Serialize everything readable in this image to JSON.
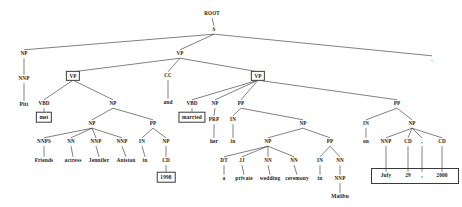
{
  "diagram": {
    "sentence": "Pitt met Friends actress Jennifer Aniston in 1998 and married her in a private wedding ceremony in Malibu on July 29 , 2000 .",
    "stroke_color": "#2b2b2b",
    "text_color": "#1a1a1a",
    "box_border_color": "#3a3a3a",
    "background": "#ffffff",
    "width": 462,
    "height": 207
  },
  "nodes": [
    {
      "id": "root",
      "label": "ROOT",
      "x": 212,
      "y": 14,
      "kind": "tag"
    },
    {
      "id": "s",
      "label": "S",
      "x": 214,
      "y": 30,
      "kind": "tag"
    },
    {
      "id": "np1",
      "label": "NP",
      "x": 24,
      "y": 54,
      "kind": "tag"
    },
    {
      "id": "vp_top",
      "label": "VP",
      "x": 180,
      "y": 54,
      "kind": "tag"
    },
    {
      "id": "period",
      "label": ".",
      "x": 432,
      "y": 60,
      "kind": "punct"
    },
    {
      "id": "nnp_pitt",
      "label": "NNP",
      "x": 24,
      "y": 79,
      "kind": "tag"
    },
    {
      "id": "vp_left",
      "label": "VP",
      "x": 73,
      "y": 76,
      "kind": "boxed-tag"
    },
    {
      "id": "cc",
      "label": "CC",
      "x": 168,
      "y": 76,
      "kind": "tag"
    },
    {
      "id": "vp_right",
      "label": "VP",
      "x": 258,
      "y": 76,
      "kind": "boxed-tag"
    },
    {
      "id": "pitt",
      "label": "Pitt",
      "x": 24,
      "y": 105,
      "kind": "leaf"
    },
    {
      "id": "vbd_met",
      "label": "VBD",
      "x": 44,
      "y": 104,
      "kind": "tag"
    },
    {
      "id": "np_obj",
      "label": "NP",
      "x": 113,
      "y": 104,
      "kind": "tag"
    },
    {
      "id": "and",
      "label": "and",
      "x": 168,
      "y": 103,
      "kind": "leaf"
    },
    {
      "id": "vbd_marr",
      "label": "VBD",
      "x": 192,
      "y": 104,
      "kind": "tag"
    },
    {
      "id": "np_her",
      "label": "NP",
      "x": 215,
      "y": 104,
      "kind": "tag"
    },
    {
      "id": "pp_in1",
      "label": "PP",
      "x": 241,
      "y": 104,
      "kind": "tag"
    },
    {
      "id": "pp_on",
      "label": "PP",
      "x": 397,
      "y": 104,
      "kind": "tag"
    },
    {
      "id": "met",
      "label": "met",
      "x": 44,
      "y": 117,
      "kind": "boxed"
    },
    {
      "id": "married",
      "label": "married",
      "x": 192,
      "y": 117,
      "kind": "boxed"
    },
    {
      "id": "np_inner",
      "label": "NP",
      "x": 92,
      "y": 124,
      "kind": "tag"
    },
    {
      "id": "pp_in98",
      "label": "PP",
      "x": 153,
      "y": 124,
      "kind": "tag"
    },
    {
      "id": "prp",
      "label": "PRP",
      "x": 214,
      "y": 120,
      "kind": "tag"
    },
    {
      "id": "in_in",
      "label": "IN",
      "x": 233,
      "y": 120,
      "kind": "tag"
    },
    {
      "id": "np_wed",
      "label": "NP",
      "x": 303,
      "y": 124,
      "kind": "tag"
    },
    {
      "id": "in_on",
      "label": "IN",
      "x": 366,
      "y": 124,
      "kind": "tag"
    },
    {
      "id": "np_date",
      "label": "NP",
      "x": 412,
      "y": 124,
      "kind": "tag"
    },
    {
      "id": "nnps",
      "label": "NNPS",
      "x": 44,
      "y": 142,
      "kind": "tag"
    },
    {
      "id": "nn_act",
      "label": "NN",
      "x": 71,
      "y": 142,
      "kind": "tag"
    },
    {
      "id": "nnp_jen",
      "label": "NNP",
      "x": 96,
      "y": 142,
      "kind": "tag"
    },
    {
      "id": "nnp_ani",
      "label": "NNP",
      "x": 122,
      "y": 142,
      "kind": "tag"
    },
    {
      "id": "in_1998",
      "label": "IN",
      "x": 142,
      "y": 142,
      "kind": "tag"
    },
    {
      "id": "np_1998",
      "label": "NP",
      "x": 166,
      "y": 142,
      "kind": "tag"
    },
    {
      "id": "her",
      "label": "her",
      "x": 214,
      "y": 142,
      "kind": "leaf"
    },
    {
      "id": "in_leaf1",
      "label": "in",
      "x": 233,
      "y": 142,
      "kind": "leaf"
    },
    {
      "id": "np_wed2",
      "label": "NP",
      "x": 268,
      "y": 142,
      "kind": "tag"
    },
    {
      "id": "pp_mal",
      "label": "PP",
      "x": 330,
      "y": 142,
      "kind": "tag"
    },
    {
      "id": "on",
      "label": "on",
      "x": 366,
      "y": 142,
      "kind": "leaf"
    },
    {
      "id": "nnp_july",
      "label": "NNP",
      "x": 386,
      "y": 142,
      "kind": "tag"
    },
    {
      "id": "cd_29",
      "label": "CD",
      "x": 408,
      "y": 142,
      "kind": "tag"
    },
    {
      "id": "comma_tag",
      "label": ",",
      "x": 422,
      "y": 142,
      "kind": "tag"
    },
    {
      "id": "cd_2000",
      "label": "CD",
      "x": 442,
      "y": 142,
      "kind": "tag"
    },
    {
      "id": "friends",
      "label": "Friends",
      "x": 44,
      "y": 161,
      "kind": "leaf"
    },
    {
      "id": "actress",
      "label": "actress",
      "x": 73,
      "y": 161,
      "kind": "leaf"
    },
    {
      "id": "jennifer",
      "label": "Jennifer",
      "x": 99,
      "y": 161,
      "kind": "leaf"
    },
    {
      "id": "aniston",
      "label": "Aniston",
      "x": 126,
      "y": 161,
      "kind": "leaf"
    },
    {
      "id": "in_leaf2",
      "label": "in",
      "x": 145,
      "y": 161,
      "kind": "leaf"
    },
    {
      "id": "cd_node",
      "label": "CD",
      "x": 166,
      "y": 161,
      "kind": "tag"
    },
    {
      "id": "dt",
      "label": "DT",
      "x": 224,
      "y": 161,
      "kind": "tag"
    },
    {
      "id": "jj",
      "label": "JJ",
      "x": 242,
      "y": 161,
      "kind": "tag"
    },
    {
      "id": "nn_wed",
      "label": "NN",
      "x": 268,
      "y": 161,
      "kind": "tag"
    },
    {
      "id": "nn_cer",
      "label": "NN",
      "x": 294,
      "y": 161,
      "kind": "tag"
    },
    {
      "id": "in_mal",
      "label": "IN",
      "x": 320,
      "y": 161,
      "kind": "tag"
    },
    {
      "id": "nn_mal",
      "label": "NN",
      "x": 340,
      "y": 161,
      "kind": "tag"
    },
    {
      "id": "july",
      "label": "July",
      "x": 386,
      "y": 176,
      "kind": "leaf"
    },
    {
      "id": "d29",
      "label": "29",
      "x": 408,
      "y": 176,
      "kind": "leaf"
    },
    {
      "id": "comma",
      "label": ",",
      "x": 422,
      "y": 176,
      "kind": "leaf"
    },
    {
      "id": "d2000",
      "label": "2000",
      "x": 442,
      "y": 176,
      "kind": "leaf"
    },
    {
      "id": "y1998",
      "label": "1998",
      "x": 166,
      "y": 177,
      "kind": "boxed"
    },
    {
      "id": "a",
      "label": "a",
      "x": 224,
      "y": 179,
      "kind": "leaf"
    },
    {
      "id": "private",
      "label": "private",
      "x": 244,
      "y": 179,
      "kind": "leaf"
    },
    {
      "id": "wedding",
      "label": "wedding",
      "x": 270,
      "y": 179,
      "kind": "leaf"
    },
    {
      "id": "ceremony",
      "label": "ceremony",
      "x": 297,
      "y": 179,
      "kind": "leaf"
    },
    {
      "id": "in_leaf3",
      "label": "in",
      "x": 320,
      "y": 179,
      "kind": "leaf"
    },
    {
      "id": "nnp_mal",
      "label": "NNP",
      "x": 340,
      "y": 179,
      "kind": "tag"
    },
    {
      "id": "malibu",
      "label": "Malibu",
      "x": 340,
      "y": 197,
      "kind": "leaf"
    }
  ],
  "edges": [
    [
      "root",
      "s"
    ],
    [
      "s",
      "np1"
    ],
    [
      "s",
      "vp_top"
    ],
    [
      "s",
      "period"
    ],
    [
      "np1",
      "nnp_pitt"
    ],
    [
      "nnp_pitt",
      "pitt"
    ],
    [
      "vp_top",
      "vp_left"
    ],
    [
      "vp_top",
      "cc"
    ],
    [
      "vp_top",
      "vp_right"
    ],
    [
      "vp_left",
      "vbd_met"
    ],
    [
      "vp_left",
      "np_obj"
    ],
    [
      "cc",
      "and"
    ],
    [
      "vbd_met",
      "met"
    ],
    [
      "np_obj",
      "np_inner"
    ],
    [
      "np_obj",
      "pp_in98"
    ],
    [
      "np_inner",
      "nnps"
    ],
    [
      "np_inner",
      "nn_act"
    ],
    [
      "np_inner",
      "nnp_jen"
    ],
    [
      "np_inner",
      "nnp_ani"
    ],
    [
      "nnps",
      "friends"
    ],
    [
      "nn_act",
      "actress"
    ],
    [
      "nnp_jen",
      "jennifer"
    ],
    [
      "nnp_ani",
      "aniston"
    ],
    [
      "pp_in98",
      "in_1998"
    ],
    [
      "pp_in98",
      "np_1998"
    ],
    [
      "in_1998",
      "in_leaf2"
    ],
    [
      "np_1998",
      "cd_node"
    ],
    [
      "cd_node",
      "y1998"
    ],
    [
      "vp_right",
      "vbd_marr"
    ],
    [
      "vp_right",
      "np_her"
    ],
    [
      "vp_right",
      "pp_in1"
    ],
    [
      "vp_right",
      "pp_on"
    ],
    [
      "vbd_marr",
      "married"
    ],
    [
      "np_her",
      "prp"
    ],
    [
      "prp",
      "her"
    ],
    [
      "pp_in1",
      "in_in"
    ],
    [
      "pp_in1",
      "np_wed"
    ],
    [
      "in_in",
      "in_leaf1"
    ],
    [
      "np_wed",
      "np_wed2"
    ],
    [
      "np_wed",
      "pp_mal"
    ],
    [
      "np_wed2",
      "dt"
    ],
    [
      "np_wed2",
      "jj"
    ],
    [
      "np_wed2",
      "nn_wed"
    ],
    [
      "np_wed2",
      "nn_cer"
    ],
    [
      "dt",
      "a"
    ],
    [
      "jj",
      "private"
    ],
    [
      "nn_wed",
      "wedding"
    ],
    [
      "nn_cer",
      "ceremony"
    ],
    [
      "pp_mal",
      "in_mal"
    ],
    [
      "pp_mal",
      "nn_mal"
    ],
    [
      "in_mal",
      "in_leaf3"
    ],
    [
      "nn_mal",
      "nnp_mal"
    ],
    [
      "nnp_mal",
      "malibu"
    ],
    [
      "pp_on",
      "in_on"
    ],
    [
      "pp_on",
      "np_date"
    ],
    [
      "in_on",
      "on"
    ],
    [
      "np_date",
      "nnp_july"
    ],
    [
      "np_date",
      "cd_29"
    ],
    [
      "np_date",
      "comma_tag"
    ],
    [
      "np_date",
      "cd_2000"
    ],
    [
      "nnp_july",
      "july"
    ],
    [
      "cd_29",
      "d29"
    ],
    [
      "comma_tag",
      "comma"
    ],
    [
      "cd_2000",
      "d2000"
    ]
  ],
  "date_box": {
    "x": 371,
    "y": 168,
    "width": 88,
    "height": 16
  }
}
